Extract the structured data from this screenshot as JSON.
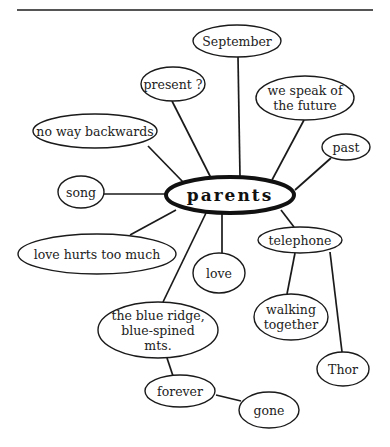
{
  "diagram": {
    "type": "cluster-map",
    "center": {
      "id": "parents",
      "label": "parents",
      "cx": 230,
      "cy": 195,
      "rx": 64,
      "ry": 18
    },
    "nodes": [
      {
        "id": "september",
        "lines": [
          "September"
        ],
        "cx": 237,
        "cy": 41,
        "rx": 44,
        "ry": 16
      },
      {
        "id": "present",
        "lines": [
          "present ?"
        ],
        "cx": 173,
        "cy": 84,
        "rx": 32,
        "ry": 17
      },
      {
        "id": "we-speak-of-the-future",
        "lines": [
          "we speak of",
          "the future"
        ],
        "cx": 305,
        "cy": 98,
        "rx": 49,
        "ry": 22
      },
      {
        "id": "no-way-backwards",
        "lines": [
          "no way backwards"
        ],
        "cx": 95,
        "cy": 131,
        "rx": 62,
        "ry": 17
      },
      {
        "id": "past",
        "lines": [
          "past"
        ],
        "cx": 346,
        "cy": 147,
        "rx": 24,
        "ry": 13
      },
      {
        "id": "song",
        "lines": [
          "song"
        ],
        "cx": 81,
        "cy": 192,
        "rx": 23,
        "ry": 16
      },
      {
        "id": "love-hurts-too-much",
        "lines": [
          "love hurts too much"
        ],
        "cx": 97,
        "cy": 254,
        "rx": 79,
        "ry": 20
      },
      {
        "id": "love",
        "lines": [
          "love"
        ],
        "cx": 219,
        "cy": 273,
        "rx": 26,
        "ry": 20
      },
      {
        "id": "telephone",
        "lines": [
          "telephone"
        ],
        "cx": 300,
        "cy": 240,
        "rx": 42,
        "ry": 13
      },
      {
        "id": "the-blue-ridge",
        "lines": [
          "the blue ridge,",
          "blue-spined",
          "mts."
        ],
        "cx": 158,
        "cy": 330,
        "rx": 60,
        "ry": 28
      },
      {
        "id": "walking-together",
        "lines": [
          "walking",
          "together"
        ],
        "cx": 291,
        "cy": 317,
        "rx": 37,
        "ry": 23
      },
      {
        "id": "thor",
        "lines": [
          "Thor"
        ],
        "cx": 343,
        "cy": 369,
        "rx": 26,
        "ry": 17
      },
      {
        "id": "forever",
        "lines": [
          "forever"
        ],
        "cx": 180,
        "cy": 391,
        "rx": 35,
        "ry": 16
      },
      {
        "id": "gone",
        "lines": [
          "gone"
        ],
        "cx": 269,
        "cy": 410,
        "rx": 30,
        "ry": 18
      }
    ],
    "edges": [
      {
        "from": "parents",
        "to": "september",
        "x1": 240,
        "y1": 177,
        "x2": 238,
        "y2": 57
      },
      {
        "from": "parents",
        "to": "present",
        "x1": 211,
        "y1": 178,
        "x2": 172,
        "y2": 101
      },
      {
        "from": "parents",
        "to": "we-speak-of-the-future",
        "x1": 272,
        "y1": 180,
        "x2": 304,
        "y2": 120
      },
      {
        "from": "parents",
        "to": "no-way-backwards",
        "x1": 183,
        "y1": 182,
        "x2": 148,
        "y2": 146
      },
      {
        "from": "parents",
        "to": "past",
        "x1": 295,
        "y1": 190,
        "x2": 331,
        "y2": 158
      },
      {
        "from": "parents",
        "to": "song",
        "x1": 166,
        "y1": 194,
        "x2": 104,
        "y2": 194
      },
      {
        "from": "parents",
        "to": "love-hurts-too-much",
        "x1": 176,
        "y1": 210,
        "x2": 130,
        "y2": 235
      },
      {
        "from": "parents",
        "to": "love",
        "x1": 222,
        "y1": 213,
        "x2": 222,
        "y2": 253
      },
      {
        "from": "parents",
        "to": "the-blue-ridge",
        "x1": 206,
        "y1": 213,
        "x2": 163,
        "y2": 302
      },
      {
        "from": "parents",
        "to": "telephone",
        "x1": 281,
        "y1": 210,
        "x2": 294,
        "y2": 227
      },
      {
        "from": "telephone",
        "to": "walking-together",
        "x1": 295,
        "y1": 253,
        "x2": 287,
        "y2": 294
      },
      {
        "from": "telephone",
        "to": "thor",
        "x1": 330,
        "y1": 252,
        "x2": 342,
        "y2": 352
      },
      {
        "from": "the-blue-ridge",
        "to": "forever",
        "x1": 167,
        "y1": 358,
        "x2": 173,
        "y2": 376
      },
      {
        "from": "forever",
        "to": "gone",
        "x1": 216,
        "y1": 395,
        "x2": 241,
        "y2": 401
      }
    ],
    "top_rule": {
      "x1": 17,
      "y1": 10,
      "x2": 373,
      "y2": 10
    }
  }
}
